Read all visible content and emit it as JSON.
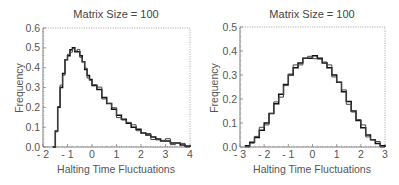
{
  "chart_data": [
    {
      "type": "line",
      "subtype": "step-histogram",
      "title": "Matrix Size = 100",
      "xlabel": "Halting Time Fluctuations",
      "ylabel": "Frequency",
      "xlim": [
        -2,
        4
      ],
      "ylim": [
        0,
        0.6
      ],
      "xticks": [
        "- 2",
        "- 1",
        "0",
        "1",
        "2",
        "3",
        "4"
      ],
      "yticks": [
        "0.0",
        "0.1",
        "0.2",
        "0.3",
        "0.4",
        "0.5",
        "0.6"
      ],
      "grid": false,
      "frame_style": "dotted",
      "series": [
        {
          "name": "histogram",
          "x": [
            -1.6,
            -1.5,
            -1.4,
            -1.3,
            -1.2,
            -1.1,
            -1.0,
            -0.9,
            -0.8,
            -0.7,
            -0.6,
            -0.5,
            -0.4,
            -0.3,
            -0.2,
            -0.1,
            0.0,
            0.2,
            0.4,
            0.6,
            0.8,
            1.0,
            1.2,
            1.4,
            1.6,
            1.8,
            2.0,
            2.2,
            2.4,
            2.6,
            2.8,
            3.0,
            3.2,
            3.4,
            3.6,
            3.8,
            4.0
          ],
          "y": [
            0.0,
            0.08,
            0.2,
            0.3,
            0.37,
            0.44,
            0.46,
            0.49,
            0.5,
            0.48,
            0.48,
            0.46,
            0.43,
            0.39,
            0.36,
            0.34,
            0.31,
            0.29,
            0.25,
            0.22,
            0.19,
            0.16,
            0.14,
            0.12,
            0.1,
            0.09,
            0.07,
            0.06,
            0.05,
            0.04,
            0.03,
            0.03,
            0.02,
            0.02,
            0.01,
            0.005,
            0.0
          ]
        }
      ]
    },
    {
      "type": "line",
      "subtype": "step-histogram",
      "title": "Matrix Size = 100",
      "xlabel": "Halting Time Fluctuations",
      "ylabel": "Frequency",
      "xlim": [
        -3,
        3
      ],
      "ylim": [
        0,
        0.5
      ],
      "xticks": [
        "- 3",
        "- 2",
        "- 1",
        "0",
        "1",
        "2",
        "3"
      ],
      "yticks": [
        "0.0",
        "0.1",
        "0.2",
        "0.3",
        "0.4",
        "0.5"
      ],
      "grid": false,
      "frame_style": "dotted",
      "series": [
        {
          "name": "histogram",
          "x": [
            -2.8,
            -2.6,
            -2.4,
            -2.2,
            -2.0,
            -1.8,
            -1.6,
            -1.4,
            -1.2,
            -1.0,
            -0.8,
            -0.6,
            -0.4,
            -0.2,
            0.0,
            0.2,
            0.4,
            0.6,
            0.8,
            1.0,
            1.2,
            1.4,
            1.6,
            1.8,
            2.0,
            2.2,
            2.4,
            2.6,
            2.8,
            3.0
          ],
          "y": [
            0.005,
            0.02,
            0.04,
            0.07,
            0.1,
            0.14,
            0.18,
            0.22,
            0.26,
            0.3,
            0.33,
            0.35,
            0.37,
            0.37,
            0.38,
            0.37,
            0.35,
            0.33,
            0.3,
            0.27,
            0.23,
            0.19,
            0.15,
            0.11,
            0.08,
            0.05,
            0.03,
            0.015,
            0.005,
            0.0
          ]
        }
      ]
    }
  ]
}
